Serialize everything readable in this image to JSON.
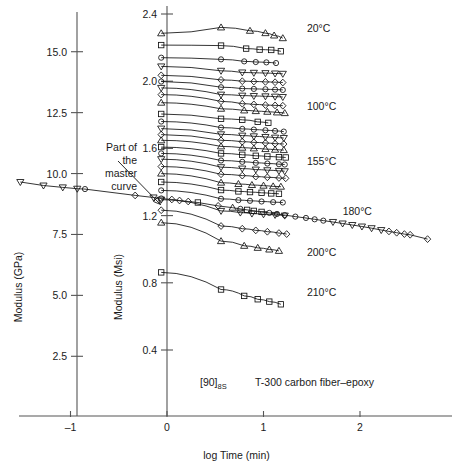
{
  "chart_data": {
    "type": "line",
    "title": "",
    "xlabel": "log Time (min)",
    "ylabel_left": "Modulus (GPa)",
    "ylabel_right": "Modulus (Msi)",
    "xlim": [
      -1.55,
      2.75
    ],
    "xticks": [
      -1,
      0,
      1,
      2
    ],
    "xticklabels": [
      "–1",
      "0",
      "1",
      "2"
    ],
    "ylim_left_gpa": [
      1.6,
      17.5
    ],
    "yticks_left": [
      2.5,
      5.0,
      7.5,
      10.0,
      12.5,
      15.0
    ],
    "yticklabels_left": [
      "2.5",
      "5.0",
      "7.5",
      "10.0",
      "12.5",
      "15.0"
    ],
    "ylim_right_msi": [
      0.23,
      2.54
    ],
    "yticks_right": [
      0.4,
      0.8,
      1.2,
      1.6,
      2.0,
      2.4
    ],
    "yticklabels_right": [
      "0.4",
      "0.8",
      "1.2",
      "1.6",
      "2.0",
      "2.4"
    ],
    "grid": false,
    "legend_position": "right-inline",
    "annotations": [
      {
        "name": "master-curve-note",
        "text_lines": [
          "Part of",
          "the",
          "master",
          "curve"
        ],
        "points_to": [
          -0.13,
          1.245
        ]
      },
      {
        "name": "specimen-label",
        "text": "[90]",
        "subscript": "8S"
      },
      {
        "name": "material-label",
        "text": "T-300 carbon fiber–epoxy"
      }
    ],
    "temperature_labels": [
      {
        "label": "20°C",
        "x": 1.45,
        "y": 2.315
      },
      {
        "label": "100°C",
        "x": 1.45,
        "y": 1.855
      },
      {
        "label": "155°C",
        "x": 1.45,
        "y": 1.525
      },
      {
        "label": "180°C",
        "x": 1.82,
        "y": 1.225
      },
      {
        "label": "200°C",
        "x": 1.45,
        "y": 0.985
      },
      {
        "label": "210°C",
        "x": 1.45,
        "y": 0.745
      }
    ],
    "master_curve": {
      "name": "master-curve",
      "x": [
        -1.52,
        -1.28,
        -1.08,
        -0.93,
        -0.85,
        -0.33,
        -0.14,
        -0.06,
        0.05,
        0.13,
        0.22,
        0.32,
        0.53,
        0.68,
        0.76,
        0.83,
        0.9,
        0.98,
        1.06,
        1.14,
        1.22,
        1.33,
        1.44,
        1.53,
        1.62,
        1.72,
        1.82,
        1.92,
        2.02,
        2.12,
        2.22,
        2.3,
        2.38,
        2.46,
        2.52,
        2.7
      ],
      "y": [
        1.4,
        1.379,
        1.368,
        1.36,
        1.358,
        1.32,
        1.308,
        1.302,
        1.296,
        1.29,
        1.284,
        1.278,
        1.258,
        1.247,
        1.24,
        1.234,
        1.228,
        1.222,
        1.216,
        1.21,
        1.203,
        1.194,
        1.186,
        1.178,
        1.17,
        1.162,
        1.153,
        1.144,
        1.135,
        1.125,
        1.114,
        1.106,
        1.098,
        1.09,
        1.086,
        1.06
      ],
      "markers": [
        "triangle-down",
        "triangle-down",
        "triangle-down",
        "triangle-down",
        "circle",
        "diamond",
        "triangle-down",
        "circle",
        "diamond",
        "diamond",
        "diamond",
        "square",
        "diamond",
        "triangle-up",
        "circle",
        "square",
        "square",
        "square",
        "circle",
        "circle",
        "circle",
        "circle",
        "circle",
        "circle",
        "circle",
        "triangle-down",
        "triangle-down",
        "triangle-down",
        "triangle-down",
        "triangle-down",
        "triangle-down",
        "diamond",
        "diamond",
        "diamond",
        "diamond",
        "diamond"
      ]
    },
    "series": [
      {
        "name": "curve-01",
        "temp": "20°C",
        "marker": "triangle-up",
        "y0": 2.285,
        "x": [
          -0.06,
          0.56,
          0.86,
          1.02,
          1.11,
          1.2
        ],
        "y": [
          2.285,
          2.32,
          2.3,
          2.286,
          2.272,
          2.256
        ]
      },
      {
        "name": "curve-02",
        "marker": "square",
        "y0": 2.215,
        "x": [
          -0.06,
          0.56,
          0.82,
          0.96,
          1.08,
          1.18
        ],
        "y": [
          2.215,
          2.212,
          2.194,
          2.188,
          2.186,
          2.178
        ]
      },
      {
        "name": "curve-03",
        "marker": "circle",
        "y0": 2.14,
        "x": [
          -0.06,
          0.56,
          0.8,
          0.92,
          1.03,
          1.13
        ],
        "y": [
          2.14,
          2.13,
          2.118,
          2.114,
          2.112,
          2.108
        ]
      },
      {
        "name": "curve-04",
        "marker": "triangle-down",
        "y0": 2.088,
        "x": [
          -0.06,
          0.56,
          0.78,
          0.9,
          1.02,
          1.12,
          1.2
        ],
        "y": [
          2.088,
          2.062,
          2.052,
          2.05,
          2.048,
          2.046,
          2.044
        ]
      },
      {
        "name": "curve-05",
        "marker": "diamond",
        "y0": 2.035,
        "x": [
          -0.06,
          0.56,
          0.78,
          0.9,
          1.02,
          1.12,
          1.2
        ],
        "y": [
          2.035,
          2.008,
          2.0,
          1.998,
          1.996,
          1.994,
          1.992
        ]
      },
      {
        "name": "curve-06",
        "marker": "circle",
        "y0": 1.998,
        "x": [
          -0.06,
          0.56,
          0.78,
          0.9,
          1.02,
          1.12,
          1.2
        ],
        "y": [
          1.998,
          1.964,
          1.956,
          1.954,
          1.952,
          1.95,
          1.948
        ]
      },
      {
        "name": "curve-07",
        "marker": "triangle-down",
        "y0": 1.96,
        "x": [
          -0.06,
          0.56,
          0.78,
          0.9,
          1.02,
          1.12,
          1.2
        ],
        "y": [
          1.96,
          1.92,
          1.914,
          1.912,
          1.91,
          1.908,
          1.906
        ]
      },
      {
        "name": "curve-08",
        "marker": "diamond",
        "y0": 1.92,
        "x": [
          -0.06,
          0.56,
          0.78,
          0.9,
          1.02,
          1.12,
          1.2
        ],
        "y": [
          1.92,
          1.88,
          1.866,
          1.862,
          1.858,
          1.856,
          1.854
        ]
      },
      {
        "name": "curve-09",
        "temp": "100°C",
        "marker": "triangle-up",
        "y0": 1.872,
        "x": [
          -0.06,
          0.56,
          0.8,
          0.92,
          1.04,
          1.14,
          1.22
        ],
        "y": [
          1.872,
          1.836,
          1.826,
          1.822,
          1.818,
          1.814,
          1.81
        ]
      },
      {
        "name": "curve-10",
        "marker": "square",
        "y0": 1.805,
        "x": [
          -0.06,
          0.56,
          0.78,
          0.94,
          1.05
        ],
        "y": [
          1.805,
          1.776,
          1.77,
          1.758,
          1.752
        ]
      },
      {
        "name": "curve-11",
        "marker": "circle",
        "y0": 1.76,
        "x": [
          -0.06,
          0.56,
          0.78,
          0.9,
          1.02,
          1.12,
          1.21
        ],
        "y": [
          1.76,
          1.724,
          1.716,
          1.712,
          1.708,
          1.704,
          1.7
        ]
      },
      {
        "name": "curve-12",
        "marker": "triangle-down",
        "y0": 1.718,
        "x": [
          -0.06,
          0.56,
          0.78,
          0.9,
          1.02,
          1.12,
          1.21
        ],
        "y": [
          1.718,
          1.684,
          1.676,
          1.672,
          1.668,
          1.664,
          1.662
        ]
      },
      {
        "name": "curve-13",
        "marker": "diamond",
        "y0": 1.682,
        "x": [
          -0.06,
          0.56,
          0.78,
          0.9,
          1.02,
          1.12,
          1.21
        ],
        "y": [
          1.682,
          1.648,
          1.64,
          1.636,
          1.632,
          1.628,
          1.626
        ]
      },
      {
        "name": "curve-14",
        "marker": "triangle-up",
        "y0": 1.648,
        "x": [
          -0.06,
          0.56,
          0.78,
          0.9,
          1.02,
          1.12,
          1.21
        ],
        "y": [
          1.648,
          1.612,
          1.604,
          1.6,
          1.596,
          1.592,
          1.59
        ]
      },
      {
        "name": "curve-15",
        "marker": "square",
        "y0": 1.608,
        "x": [
          -0.06,
          0.56,
          0.78,
          0.92,
          1.04,
          1.16,
          1.23
        ],
        "y": [
          1.608,
          1.57,
          1.562,
          1.556,
          1.552,
          1.548,
          1.546
        ]
      },
      {
        "name": "curve-16",
        "temp": "155°C",
        "marker": "circle",
        "y0": 1.57,
        "x": [
          -0.06,
          0.56,
          0.78,
          0.92,
          1.04,
          1.16,
          1.22
        ],
        "y": [
          1.57,
          1.528,
          1.52,
          1.514,
          1.51,
          1.506,
          1.504
        ]
      },
      {
        "name": "curve-17",
        "marker": "triangle-down",
        "y0": 1.536,
        "x": [
          -0.06,
          0.56,
          0.78,
          0.92,
          1.04,
          1.16,
          1.22
        ],
        "y": [
          1.536,
          1.488,
          1.48,
          1.474,
          1.47,
          1.466,
          1.464
        ]
      },
      {
        "name": "curve-18",
        "marker": "diamond",
        "y0": 1.492,
        "x": [
          -0.06,
          0.56,
          0.78,
          0.92,
          1.04,
          1.16,
          1.23
        ],
        "y": [
          1.492,
          1.446,
          1.438,
          1.432,
          1.428,
          1.424,
          1.422
        ]
      },
      {
        "name": "curve-19",
        "marker": "triangle-up",
        "y0": 1.45,
        "x": [
          -0.06,
          0.56,
          0.74,
          0.88,
          1.0,
          1.1,
          1.18
        ],
        "y": [
          1.45,
          1.396,
          1.388,
          1.382,
          1.378,
          1.374,
          1.372
        ]
      },
      {
        "name": "curve-20",
        "temp": "180°C",
        "marker": "square",
        "y0": 1.4,
        "x": [
          -0.06,
          0.56,
          0.74,
          0.86,
          0.98,
          1.08,
          1.16
        ],
        "y": [
          1.4,
          1.352,
          1.344,
          1.34,
          1.336,
          1.332,
          1.33
        ]
      },
      {
        "name": "curve-21",
        "marker": "circle",
        "y0": 1.35,
        "x": [
          -0.06,
          0.56,
          0.74,
          0.86,
          0.98,
          1.1,
          1.2
        ],
        "y": [
          1.35,
          1.3,
          1.292,
          1.288,
          1.284,
          1.28,
          1.278
        ]
      },
      {
        "name": "curve-22",
        "marker": "triangle-down",
        "y0": 1.295,
        "x": [
          -0.06,
          0.56,
          0.76,
          0.88,
          1.0,
          1.12,
          1.22
        ],
        "y": [
          1.295,
          1.228,
          1.218,
          1.212,
          1.208,
          1.204,
          1.2
        ]
      },
      {
        "name": "curve-23",
        "temp": "200°C",
        "marker": "diamond",
        "y0": 1.232,
        "x": [
          -0.06,
          0.56,
          0.78,
          0.92,
          1.04,
          1.16,
          1.24
        ],
        "y": [
          1.232,
          1.138,
          1.122,
          1.112,
          1.104,
          1.096,
          1.09
        ]
      },
      {
        "name": "curve-24",
        "marker": "triangle-up",
        "y0": 1.158,
        "x": [
          -0.06,
          0.56,
          0.8,
          0.94,
          1.06,
          1.16
        ],
        "y": [
          1.158,
          1.048,
          1.02,
          1.008,
          0.998,
          0.99
        ]
      },
      {
        "name": "curve-25",
        "temp": "210°C",
        "marker": "square",
        "y0": 0.862,
        "x": [
          -0.06,
          0.56,
          0.8,
          0.94,
          1.06,
          1.18
        ],
        "y": [
          0.862,
          0.76,
          0.722,
          0.702,
          0.688,
          0.672
        ]
      }
    ]
  }
}
